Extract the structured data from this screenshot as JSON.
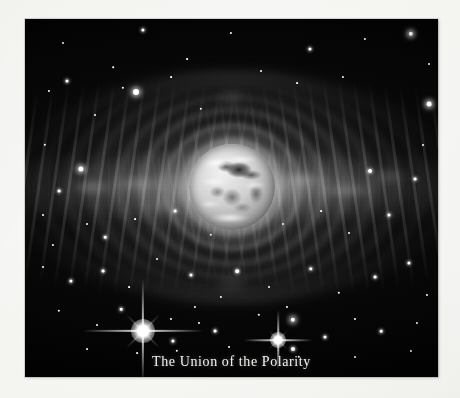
{
  "figure": {
    "caption": "The Union of the Polarity",
    "medium": "grayscale astronomical illustration",
    "subject_label": "planet-earth-sphere",
    "colors": {
      "page_background": "#f8f8f6",
      "plate_background": "#000000",
      "caption_text": "#f2f2ee",
      "nebula_light": "#cecece",
      "star_white": "#ffffff"
    },
    "plate": {
      "left": 25,
      "top": 19,
      "width": 413,
      "height": 358
    }
  },
  "scene": {
    "planet": {
      "name": "central-planet",
      "center_x_pct": 50,
      "center_y_pct": 47,
      "diameter_px": 86
    },
    "nebula": {
      "name": "bipolar-nebula",
      "shells": [
        {
          "w": 96,
          "h": 92,
          "opacity": 0.4
        },
        {
          "w": 132,
          "h": 120,
          "opacity": 0.34
        },
        {
          "w": 176,
          "h": 150,
          "opacity": 0.3
        },
        {
          "w": 222,
          "h": 176,
          "opacity": 0.26
        },
        {
          "w": 272,
          "h": 198,
          "opacity": 0.22
        },
        {
          "w": 324,
          "h": 214,
          "opacity": 0.18
        },
        {
          "w": 378,
          "h": 222,
          "opacity": 0.14
        },
        {
          "w": 424,
          "h": 224,
          "opacity": 0.1
        }
      ]
    },
    "starbursts": [
      {
        "name": "starburst-left",
        "x": 118,
        "y": 312,
        "size": 7.5,
        "spike": 60
      },
      {
        "name": "starburst-right",
        "x": 253,
        "y": 321,
        "size": 5.0,
        "spike": 34
      }
    ],
    "stars": [
      {
        "x": 38,
        "y": 24,
        "r": 1.0,
        "g": 0
      },
      {
        "x": 118,
        "y": 11,
        "r": 1.6,
        "g": 1
      },
      {
        "x": 162,
        "y": 40,
        "r": 0.9,
        "g": 0
      },
      {
        "x": 206,
        "y": 14,
        "r": 1.1,
        "g": 0
      },
      {
        "x": 285,
        "y": 30,
        "r": 1.6,
        "g": 1
      },
      {
        "x": 340,
        "y": 20,
        "r": 1.1,
        "g": 0
      },
      {
        "x": 386,
        "y": 15,
        "r": 2.2,
        "g": 2
      },
      {
        "x": 404,
        "y": 45,
        "r": 1.0,
        "g": 0
      },
      {
        "x": 24,
        "y": 72,
        "r": 1.1,
        "g": 0
      },
      {
        "x": 42,
        "y": 62,
        "r": 1.5,
        "g": 1
      },
      {
        "x": 88,
        "y": 48,
        "r": 0.8,
        "g": 0
      },
      {
        "x": 98,
        "y": 69,
        "r": 1.2,
        "g": 0
      },
      {
        "x": 111,
        "y": 73,
        "r": 3.0,
        "g": 2
      },
      {
        "x": 146,
        "y": 58,
        "r": 0.9,
        "g": 0
      },
      {
        "x": 70,
        "y": 96,
        "r": 1.0,
        "g": 0
      },
      {
        "x": 176,
        "y": 90,
        "r": 1.2,
        "g": 0
      },
      {
        "x": 236,
        "y": 52,
        "r": 1.0,
        "g": 0
      },
      {
        "x": 272,
        "y": 64,
        "r": 0.9,
        "g": 0
      },
      {
        "x": 318,
        "y": 58,
        "r": 1.1,
        "g": 0
      },
      {
        "x": 404,
        "y": 85,
        "r": 2.4,
        "g": 2
      },
      {
        "x": 398,
        "y": 126,
        "r": 1.0,
        "g": 0
      },
      {
        "x": 20,
        "y": 126,
        "r": 1.2,
        "g": 0
      },
      {
        "x": 56,
        "y": 150,
        "r": 2.6,
        "g": 2
      },
      {
        "x": 34,
        "y": 172,
        "r": 1.4,
        "g": 1
      },
      {
        "x": 18,
        "y": 196,
        "r": 1.0,
        "g": 0
      },
      {
        "x": 345,
        "y": 152,
        "r": 2.0,
        "g": 1
      },
      {
        "x": 390,
        "y": 160,
        "r": 1.4,
        "g": 1
      },
      {
        "x": 28,
        "y": 226,
        "r": 1.1,
        "g": 0
      },
      {
        "x": 62,
        "y": 205,
        "r": 1.0,
        "g": 0
      },
      {
        "x": 80,
        "y": 218,
        "r": 1.3,
        "g": 1
      },
      {
        "x": 110,
        "y": 200,
        "r": 0.9,
        "g": 0
      },
      {
        "x": 150,
        "y": 192,
        "r": 1.4,
        "g": 1
      },
      {
        "x": 186,
        "y": 216,
        "r": 1.2,
        "g": 0
      },
      {
        "x": 198,
        "y": 199,
        "r": 0.9,
        "g": 0
      },
      {
        "x": 228,
        "y": 182,
        "r": 1.0,
        "g": 0
      },
      {
        "x": 258,
        "y": 205,
        "r": 1.1,
        "g": 0
      },
      {
        "x": 296,
        "y": 192,
        "r": 0.9,
        "g": 0
      },
      {
        "x": 324,
        "y": 214,
        "r": 1.0,
        "g": 0
      },
      {
        "x": 364,
        "y": 196,
        "r": 1.5,
        "g": 1
      },
      {
        "x": 18,
        "y": 248,
        "r": 1.0,
        "g": 0
      },
      {
        "x": 46,
        "y": 262,
        "r": 1.6,
        "g": 1
      },
      {
        "x": 78,
        "y": 252,
        "r": 1.4,
        "g": 1
      },
      {
        "x": 104,
        "y": 268,
        "r": 0.9,
        "g": 0
      },
      {
        "x": 132,
        "y": 240,
        "r": 1.0,
        "g": 0
      },
      {
        "x": 166,
        "y": 256,
        "r": 1.5,
        "g": 1
      },
      {
        "x": 196,
        "y": 278,
        "r": 1.1,
        "g": 0
      },
      {
        "x": 212,
        "y": 252,
        "r": 1.8,
        "g": 1
      },
      {
        "x": 244,
        "y": 268,
        "r": 1.0,
        "g": 0
      },
      {
        "x": 286,
        "y": 250,
        "r": 1.7,
        "g": 1
      },
      {
        "x": 314,
        "y": 274,
        "r": 1.2,
        "g": 0
      },
      {
        "x": 350,
        "y": 258,
        "r": 1.4,
        "g": 1
      },
      {
        "x": 384,
        "y": 244,
        "r": 1.6,
        "g": 1
      },
      {
        "x": 402,
        "y": 276,
        "r": 1.0,
        "g": 0
      },
      {
        "x": 34,
        "y": 292,
        "r": 1.2,
        "g": 0
      },
      {
        "x": 72,
        "y": 306,
        "r": 1.0,
        "g": 0
      },
      {
        "x": 96,
        "y": 290,
        "r": 1.3,
        "g": 1
      },
      {
        "x": 146,
        "y": 300,
        "r": 1.0,
        "g": 0
      },
      {
        "x": 170,
        "y": 288,
        "r": 1.1,
        "g": 0
      },
      {
        "x": 190,
        "y": 312,
        "r": 1.4,
        "g": 1
      },
      {
        "x": 234,
        "y": 296,
        "r": 1.2,
        "g": 0
      },
      {
        "x": 262,
        "y": 288,
        "r": 1.0,
        "g": 0
      },
      {
        "x": 268,
        "y": 301,
        "r": 2.2,
        "g": 2
      },
      {
        "x": 300,
        "y": 318,
        "r": 1.5,
        "g": 1
      },
      {
        "x": 330,
        "y": 300,
        "r": 1.0,
        "g": 0
      },
      {
        "x": 356,
        "y": 312,
        "r": 1.3,
        "g": 1
      },
      {
        "x": 392,
        "y": 304,
        "r": 1.1,
        "g": 0
      },
      {
        "x": 268,
        "y": 330,
        "r": 2.0,
        "g": 1
      },
      {
        "x": 274,
        "y": 338,
        "r": 1.2,
        "g": 0
      },
      {
        "x": 148,
        "y": 322,
        "r": 1.6,
        "g": 1
      },
      {
        "x": 152,
        "y": 332,
        "r": 1.2,
        "g": 0
      },
      {
        "x": 174,
        "y": 304,
        "r": 1.0,
        "g": 0
      },
      {
        "x": 112,
        "y": 334,
        "r": 0.9,
        "g": 0
      },
      {
        "x": 204,
        "y": 328,
        "r": 1.0,
        "g": 0
      },
      {
        "x": 62,
        "y": 330,
        "r": 0.9,
        "g": 0
      },
      {
        "x": 330,
        "y": 338,
        "r": 1.0,
        "g": 0
      },
      {
        "x": 386,
        "y": 332,
        "r": 1.1,
        "g": 0
      }
    ]
  }
}
